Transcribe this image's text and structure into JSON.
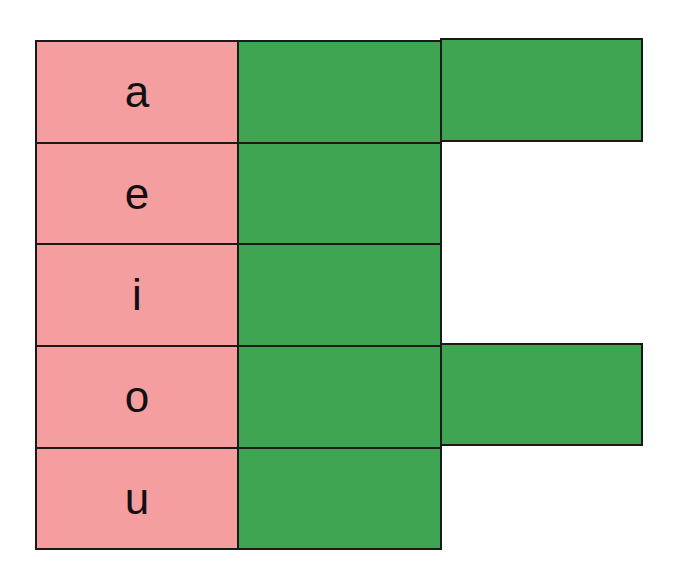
{
  "diagram": {
    "colors": {
      "label_cell": "#f59ea0",
      "filled_cell": "#3fa553",
      "border": "#1a1a1a"
    },
    "rows": [
      {
        "label": "a",
        "filled": 2
      },
      {
        "label": "e",
        "filled": 1
      },
      {
        "label": "i",
        "filled": 1
      },
      {
        "label": "o",
        "filled": 2
      },
      {
        "label": "u",
        "filled": 1
      }
    ]
  }
}
